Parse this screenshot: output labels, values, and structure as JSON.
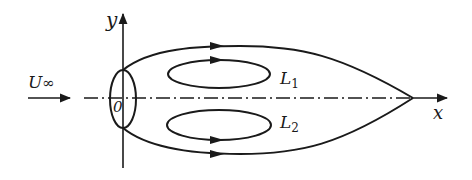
{
  "figure": {
    "type": "flow-schematic",
    "stroke_color": "#1a1a1a",
    "background_color": "#ffffff"
  },
  "labels": {
    "y_axis": "y",
    "x_axis": "x",
    "free_stream": "U",
    "free_stream_sub": "∞",
    "origin": "0",
    "loop_upper": "L",
    "loop_upper_index": "1",
    "loop_lower": "L",
    "loop_lower_index": "2"
  }
}
